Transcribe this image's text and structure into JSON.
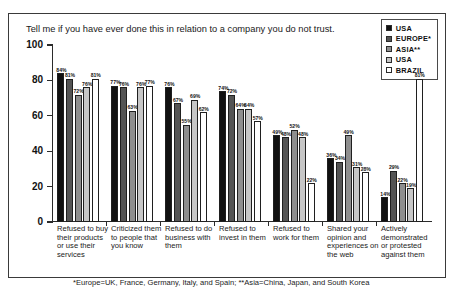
{
  "breadcrumb": "••••••••  •••••••••••  ••••••",
  "question": "Tell me if you have ever done this in relation to a company you do not trust.",
  "footnote": "*Europe=UK, France, Germany, Italy, and Spain; **Asia=China, Japan, and South Korea",
  "legend": {
    "items": [
      {
        "label": "USA",
        "color": "#111111"
      },
      {
        "label": "EUROPE*",
        "color": "#545454"
      },
      {
        "label": "ASIA**",
        "color": "#8e8e8e"
      },
      {
        "label": "USA",
        "color": "#c6c6c6"
      },
      {
        "label": "BRAZIL",
        "color": "#ffffff"
      }
    ]
  },
  "chart_data": {
    "type": "bar",
    "title": "Tell me if you have ever done this in relation to a company you do not trust.",
    "xlabel": "",
    "ylabel": "",
    "ylim": [
      0,
      100
    ],
    "yticks": [
      0,
      20,
      40,
      60,
      80,
      100
    ],
    "grid": false,
    "legend_position": "top-right",
    "value_suffix": "%",
    "categories": [
      "Refused to buy their products or use their services",
      "Criticized them to people that you know",
      "Refused to do business with them",
      "Refused to invest in them",
      "Refused to work for them",
      "Shared your opinion and experiences on the web",
      "Actively demonstrated or protested against them"
    ],
    "series": [
      {
        "name": "USA",
        "color": "#111111",
        "values": [
          84,
          77,
          76,
          74,
          49,
          36,
          14
        ]
      },
      {
        "name": "EUROPE*",
        "color": "#545454",
        "values": [
          81,
          76,
          67,
          72,
          48,
          34,
          29
        ]
      },
      {
        "name": "ASIA**",
        "color": "#8e8e8e",
        "values": [
          72,
          63,
          55,
          64,
          52,
          49,
          22
        ]
      },
      {
        "name": "USA",
        "color": "#c6c6c6",
        "values": [
          76,
          76,
          69,
          64,
          48,
          31,
          19
        ]
      },
      {
        "name": "BRAZIL",
        "color": "#ffffff",
        "values": [
          81,
          77,
          62,
          57,
          22,
          28,
          81
        ]
      }
    ]
  }
}
